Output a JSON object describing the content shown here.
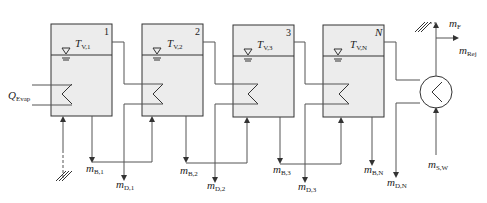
{
  "diagram": {
    "colors": {
      "tank_fill": "#ececec",
      "stroke": "#333333",
      "line": "#555555"
    },
    "stages": [
      {
        "number": "1",
        "temp_label": "T",
        "temp_sub": "V,1",
        "brine": "m",
        "brine_sub": "B,1",
        "distillate": "m",
        "distillate_sub": "D,1"
      },
      {
        "number": "2",
        "temp_label": "T",
        "temp_sub": "V,2",
        "brine": "m",
        "brine_sub": "B,2",
        "distillate": "m",
        "distillate_sub": "D,2"
      },
      {
        "number": "3",
        "temp_label": "T",
        "temp_sub": "V,3",
        "brine": "m",
        "brine_sub": "B,3",
        "distillate": "m",
        "distillate_sub": "D,3"
      },
      {
        "number": "N",
        "temp_label": "T",
        "temp_sub": "V,N",
        "brine": "m",
        "brine_sub": "B,N",
        "distillate": "m",
        "distillate_sub": "D,N"
      }
    ],
    "heat_input": {
      "label": "Q",
      "sub": "Evap"
    },
    "condenser": {
      "feed": {
        "label": "m",
        "sub": "F"
      },
      "reject": {
        "label": "m",
        "sub": "Rej"
      },
      "seawater": {
        "label": "m",
        "sub": "S,W"
      }
    }
  }
}
